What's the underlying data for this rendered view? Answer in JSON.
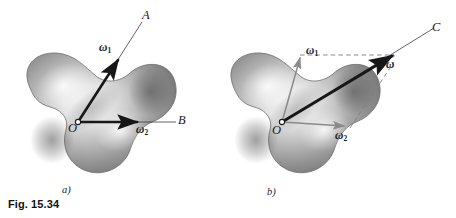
{
  "figure": {
    "caption": "Fig. 15.34",
    "panels": [
      {
        "id": "a",
        "label": "a)",
        "body_name": "rigid-body-blob",
        "origin_label": "O",
        "axis_labels": [
          "A",
          "B"
        ],
        "vectors": [
          {
            "name": "omega-1",
            "symbol": "ω",
            "subscript": "1",
            "style": "solid-black",
            "axis": "A"
          },
          {
            "name": "omega-2",
            "symbol": "ω",
            "subscript": "2",
            "style": "solid-black",
            "axis": "B"
          }
        ]
      },
      {
        "id": "b",
        "label": "b)",
        "body_name": "rigid-body-blob",
        "origin_label": "O",
        "axis_labels": [
          "C"
        ],
        "vectors": [
          {
            "name": "omega-1",
            "symbol": "ω",
            "subscript": "1",
            "style": "thin-gray",
            "axis": ""
          },
          {
            "name": "omega-2",
            "symbol": "ω",
            "subscript": "2",
            "style": "thin-gray",
            "axis": ""
          },
          {
            "name": "omega-resultant",
            "symbol": "ω",
            "subscript": "",
            "style": "thick-black",
            "axis": "C"
          }
        ],
        "construction": "parallelogram-dashed"
      }
    ]
  },
  "colors": {
    "background": "#ffffff",
    "ink": "#1b1b1b",
    "vector_black": "#171717",
    "vector_gray": "#8a8a8a",
    "dashed_gray": "#7d7d7d",
    "body_light": "#efefef",
    "body_mid": "#9a9a9a",
    "body_dark": "#5d5d5d",
    "body_outline": "#6f6f6f"
  }
}
